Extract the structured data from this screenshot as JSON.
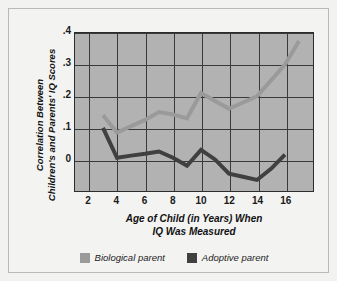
{
  "chart_data": {
    "type": "line",
    "title": "",
    "xlabel": "Age of Child (in Years) When IQ Was Measured",
    "xlabel_line1": "Age of Child (in Years) When",
    "xlabel_line2": "IQ Was Measured",
    "ylabel": "Correlation Between Children's and Parents' IQ Scores",
    "ylabel_line1": "Correlation Between",
    "ylabel_line2": "Children's and Parents' IQ Scores",
    "xlim": [
      1,
      18
    ],
    "ylim": [
      -0.1,
      0.4
    ],
    "xticks": [
      2,
      4,
      6,
      8,
      10,
      12,
      14,
      16
    ],
    "xtick_labels": [
      "2",
      "4",
      "6",
      "8",
      "10",
      "12",
      "14",
      "16"
    ],
    "yticks": [
      0,
      0.1,
      0.2,
      0.3,
      0.4
    ],
    "ytick_labels": [
      "0",
      ".1",
      ".2",
      ".3",
      ".4"
    ],
    "grid": true,
    "legend_position": "below",
    "series": [
      {
        "name": "Biological parent",
        "color": "#9a9a9a",
        "x": [
          3,
          4,
          5,
          6,
          7,
          8,
          9,
          10,
          11,
          12,
          13,
          14,
          15,
          16,
          17
        ],
        "values": [
          0.14,
          0.085,
          0.105,
          0.125,
          0.15,
          0.142,
          0.13,
          0.21,
          0.185,
          0.16,
          0.18,
          0.2,
          0.25,
          0.3,
          0.375
        ]
      },
      {
        "name": "Adoptive parent",
        "color": "#404040",
        "x": [
          3,
          4,
          5,
          6,
          7,
          8,
          9,
          10,
          11,
          12,
          13,
          14,
          15,
          16
        ],
        "values": [
          0.1,
          0.005,
          0.012,
          0.018,
          0.025,
          0.005,
          -0.02,
          0.03,
          0.0,
          -0.045,
          -0.055,
          -0.065,
          -0.03,
          0.015
        ]
      }
    ]
  },
  "legend": {
    "items": [
      {
        "label": "Biological parent",
        "color": "#9a9a9a"
      },
      {
        "label": "Adoptive parent",
        "color": "#404040"
      }
    ]
  },
  "colors": {
    "page_background": "#f2f2f0",
    "frame_background": "#f3f3f1",
    "frame_border": "#b9b9b5",
    "plot_background": "#b2b2b2",
    "grid": "#3a3a3a",
    "axis": "#2c2c2c",
    "biological_parent": "#9a9a9a",
    "adoptive_parent": "#404040",
    "text": "#111111"
  }
}
